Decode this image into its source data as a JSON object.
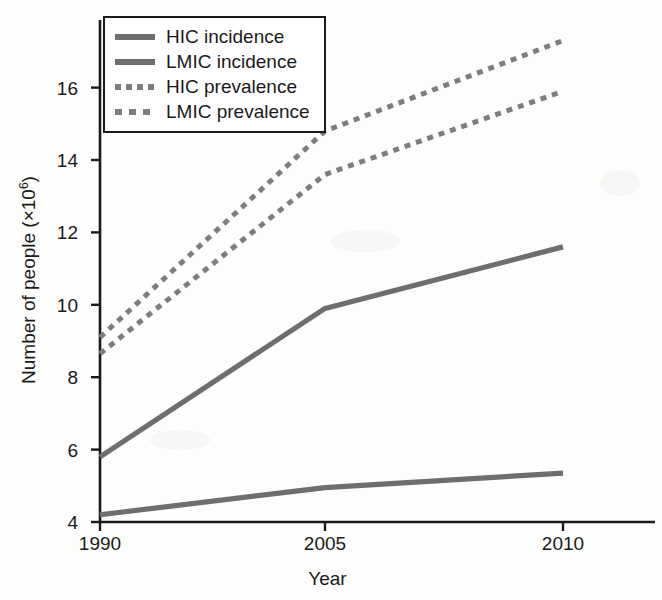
{
  "chart_data": {
    "type": "line",
    "title": "",
    "xlabel": "Year",
    "ylabel_prefix": "Number of people (×10",
    "ylabel_exponent": "6",
    "ylabel_suffix": ")",
    "ylabel_full": "Number of people (×10⁶)",
    "x": [
      1990,
      2005,
      2010
    ],
    "xtick_labels": [
      "1990",
      "2005",
      "2010"
    ],
    "ytick_labels": [
      "4",
      "6",
      "8",
      "10",
      "12",
      "14",
      "16"
    ],
    "ytick_values": [
      4,
      6,
      8,
      10,
      12,
      14,
      16
    ],
    "xlim": [
      1990,
      2010
    ],
    "ylim": [
      4,
      17.7
    ],
    "grid": false,
    "legend_position": "top-left",
    "series": [
      {
        "name": "HIC incidence",
        "style": "solid",
        "color": "#6e6e6e",
        "values": [
          4.2,
          4.95,
          5.35
        ]
      },
      {
        "name": "LMIC incidence",
        "style": "solid",
        "color": "#6e6e6e",
        "values": [
          5.8,
          9.9,
          11.6
        ]
      },
      {
        "name": "HIC prevalence",
        "style": "dotted",
        "color": "#7d7d7d",
        "values": [
          9.1,
          14.8,
          17.3
        ]
      },
      {
        "name": "LMIC prevalence",
        "style": "dotted",
        "color": "#7d7d7d",
        "values": [
          8.65,
          13.6,
          15.9
        ]
      }
    ]
  },
  "legend": {
    "items": [
      {
        "label": "HIC incidence",
        "style": "solid"
      },
      {
        "label": "LMIC incidence",
        "style": "solid"
      },
      {
        "label": "HIC prevalence",
        "style": "dotted"
      },
      {
        "label": "LMIC prevalence",
        "style": "dotted-wide"
      }
    ]
  },
  "axes": {
    "axis_color": "#1a1a1a"
  }
}
